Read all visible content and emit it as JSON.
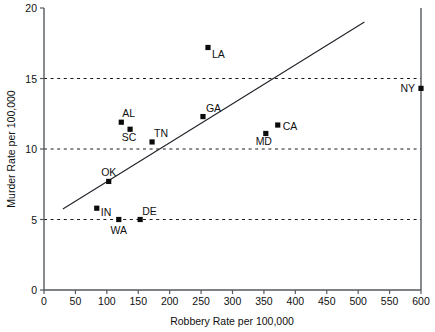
{
  "chart_data": {
    "type": "scatter",
    "title": "",
    "xlabel": "Robbery Rate per 100,000",
    "ylabel": "Murder Rate per 100,000",
    "xlim": [
      0,
      600
    ],
    "ylim": [
      0,
      20
    ],
    "xticks": [
      0,
      50,
      100,
      150,
      200,
      250,
      300,
      350,
      400,
      450,
      500,
      550,
      600
    ],
    "yticks": [
      0,
      5,
      10,
      15,
      20
    ],
    "xtick_labels": [
      "0",
      "50",
      "100",
      "150",
      "200",
      "250",
      "300",
      "350",
      "400",
      "450",
      "500",
      "550",
      "600"
    ],
    "ytick_labels": [
      "0",
      "5",
      "10",
      "15",
      "20"
    ],
    "grid": "horizontal dashed gridlines at y = 5, 10, 15",
    "gridlines_y": [
      5,
      10,
      15
    ],
    "legend": "none",
    "marker_style": "filled black square",
    "points": [
      {
        "label": "LA",
        "x": 261,
        "y": 17.2,
        "label_dx": 4,
        "label_dy": 11
      },
      {
        "label": "NY",
        "x": 600,
        "y": 14.3,
        "label_dx": -6,
        "label_dy": 4,
        "label_anchor": "end"
      },
      {
        "label": "GA",
        "x": 253,
        "y": 12.3,
        "label_dx": 3,
        "label_dy": -5
      },
      {
        "label": "AL",
        "x": 123,
        "y": 11.9,
        "label_dx": 1,
        "label_dy": -5
      },
      {
        "label": "SC",
        "x": 137,
        "y": 11.4,
        "label_dx": -1,
        "label_dy": 12,
        "label_anchor": "middle"
      },
      {
        "label": "CA",
        "x": 372,
        "y": 11.7,
        "label_dx": 5,
        "label_dy": 5
      },
      {
        "label": "MD",
        "x": 353,
        "y": 11.1,
        "label_dx": -2,
        "label_dy": 12,
        "label_anchor": "middle"
      },
      {
        "label": "TN",
        "x": 172,
        "y": 10.5,
        "label_dx": 2,
        "label_dy": -5
      },
      {
        "label": "OK",
        "x": 103,
        "y": 7.7,
        "label_dx": 0,
        "label_dy": -5,
        "label_anchor": "middle"
      },
      {
        "label": "IN",
        "x": 84,
        "y": 5.8,
        "label_dx": 4,
        "label_dy": 8
      },
      {
        "label": "DE",
        "x": 153,
        "y": 5.0,
        "label_dx": 2,
        "label_dy": -5
      },
      {
        "label": "WA",
        "x": 119,
        "y": 5.0,
        "label_dx": 0,
        "label_dy": 14,
        "label_anchor": "middle"
      }
    ],
    "fit_line": {
      "description": "regression trend line",
      "x_start": 30,
      "y_start": 5.75,
      "x_end": 510,
      "y_end": 19.0
    }
  },
  "colors": {
    "background": "#ffffff",
    "axis": "#555a5e",
    "marker": "#0b0b0b",
    "gridline": "#1b1b1b",
    "fit_line": "#20242a",
    "text": "#101010"
  }
}
